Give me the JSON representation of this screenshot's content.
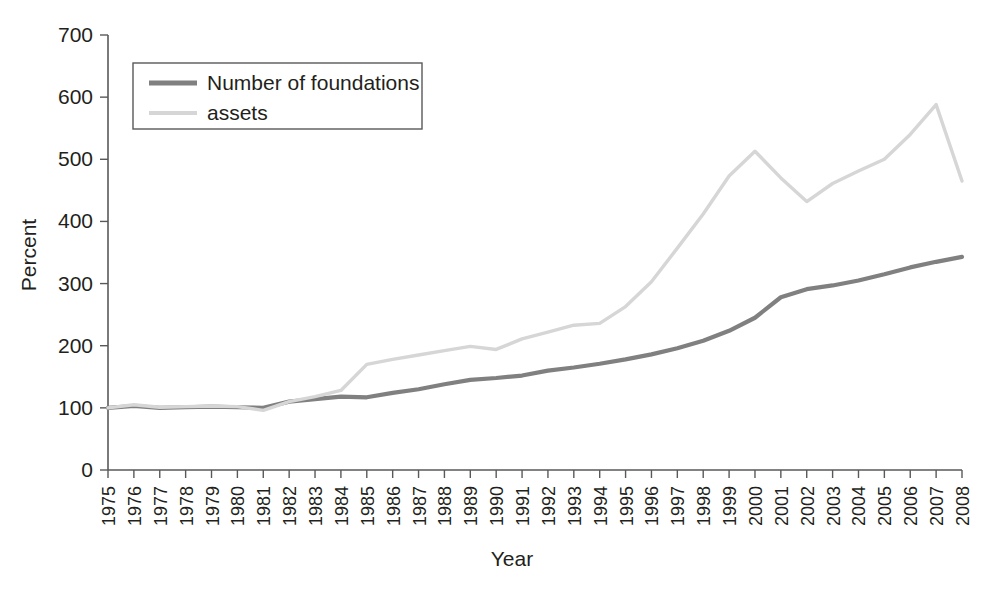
{
  "chart_data": {
    "type": "line",
    "title": "",
    "xlabel": "Year",
    "ylabel": "Percent",
    "xlim": [
      1975,
      2008
    ],
    "ylim": [
      0,
      700
    ],
    "ytick_values": [
      0,
      100,
      200,
      300,
      400,
      500,
      600,
      700
    ],
    "ytick_labels": [
      "0",
      "100",
      "200",
      "300",
      "400",
      "500",
      "600",
      "700"
    ],
    "grid": false,
    "legend_position": "upper-left",
    "x": [
      1975,
      1976,
      1977,
      1978,
      1979,
      1980,
      1981,
      1982,
      1983,
      1984,
      1985,
      1986,
      1987,
      1988,
      1989,
      1990,
      1991,
      1992,
      1993,
      1994,
      1995,
      1996,
      1997,
      1998,
      1999,
      2000,
      2001,
      2002,
      2003,
      2004,
      2005,
      2006,
      2007,
      2008
    ],
    "categories": [
      "1975",
      "1976",
      "1977",
      "1978",
      "1979",
      "1980",
      "1981",
      "1982",
      "1983",
      "1984",
      "1985",
      "1986",
      "1987",
      "1988",
      "1989",
      "1990",
      "1991",
      "1992",
      "1993",
      "1994",
      "1995",
      "1996",
      "1997",
      "1998",
      "1999",
      "2000",
      "2001",
      "2002",
      "2003",
      "2004",
      "2005",
      "2006",
      "2007",
      "2008"
    ],
    "series": [
      {
        "name": "Number of foundations",
        "color": "#808080",
        "values": [
          100,
          103,
          100,
          101,
          102,
          101,
          100,
          110,
          114,
          118,
          117,
          124,
          130,
          138,
          145,
          148,
          152,
          160,
          165,
          171,
          178,
          186,
          196,
          208,
          224,
          245,
          278,
          291,
          297,
          305,
          315,
          326,
          335,
          343
        ]
      },
      {
        "name": "assets",
        "color": "#d6d6d6",
        "values": [
          100,
          105,
          101,
          102,
          103,
          102,
          96,
          110,
          118,
          128,
          170,
          178,
          185,
          192,
          199,
          194,
          211,
          222,
          233,
          236,
          263,
          303,
          357,
          412,
          473,
          513,
          470,
          432,
          461,
          481,
          500,
          540,
          588,
          465
        ]
      }
    ]
  },
  "legend": {
    "items": [
      {
        "label": "Number of foundations",
        "color": "#808080"
      },
      {
        "label": "assets",
        "color": "#d6d6d6"
      }
    ]
  }
}
